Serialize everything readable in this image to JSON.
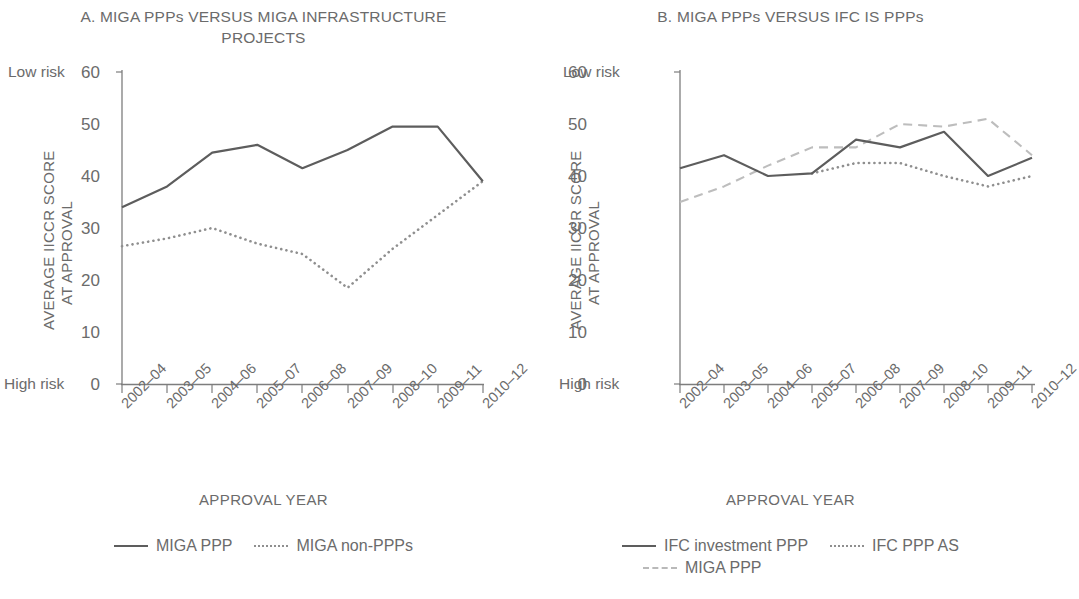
{
  "figure": {
    "axis": {
      "y_title": "AVERAGE IICCR SCORE",
      "y_title_line2": "AT APPROVAL",
      "x_title": "APPROVAL YEAR",
      "y_low_label": "Low risk",
      "y_high_label": "High risk",
      "y_ticks": [
        "60",
        "50",
        "40",
        "30",
        "20",
        "10",
        "0"
      ],
      "x_ticks": [
        "2002–04",
        "2003–05",
        "2004–06",
        "2005–07",
        "2006–08",
        "2007–09",
        "2008–10",
        "2009–11",
        "2010–12"
      ]
    },
    "colors": {
      "solid": "#5d5d5d",
      "dotted": "#8f8f8f",
      "dashed": "#bdbdbd",
      "axis": "#7d7d7d",
      "text": "#6b6b6b"
    }
  },
  "chart_data": [
    {
      "type": "line",
      "panel": "A",
      "title": "A. MIGA PPPs VERSUS MIGA INFRASTRUCTURE PROJECTS",
      "xlabel": "APPROVAL YEAR",
      "ylabel": "AVERAGE IICCR SCORE AT APPROVAL",
      "ylim": [
        0,
        60
      ],
      "yticks": [
        0,
        10,
        20,
        30,
        40,
        50,
        60
      ],
      "grid": false,
      "legend_position": "bottom",
      "categories": [
        "2002–04",
        "2003–05",
        "2004–06",
        "2005–07",
        "2006–08",
        "2007–09",
        "2008–10",
        "2009–11",
        "2010–12"
      ],
      "series": [
        {
          "name": "MIGA PPP",
          "style": "solid",
          "values": [
            34,
            38,
            44.5,
            46,
            41.5,
            45,
            49.5,
            49.5,
            39
          ]
        },
        {
          "name": "MIGA non-PPPs",
          "style": "dotted",
          "values": [
            26.5,
            28,
            30,
            27,
            25,
            18.5,
            26,
            32.5,
            39
          ]
        }
      ],
      "annotations": {
        "y_axis_top": "Low risk",
        "y_axis_bottom": "High risk"
      }
    },
    {
      "type": "line",
      "panel": "B",
      "title": "B. MIGA PPPs VERSUS IFC IS PPPs",
      "xlabel": "APPROVAL YEAR",
      "ylabel": "AVERAGE IICCR SCORE AT APPROVAL",
      "ylim": [
        0,
        60
      ],
      "yticks": [
        0,
        10,
        20,
        30,
        40,
        50,
        60
      ],
      "grid": false,
      "legend_position": "bottom",
      "categories": [
        "2002–04",
        "2003–05",
        "2004–06",
        "2005–07",
        "2006–08",
        "2007–09",
        "2008–10",
        "2009–11",
        "2010–12"
      ],
      "series": [
        {
          "name": "IFC investment PPP",
          "style": "solid",
          "values": [
            41.5,
            44,
            40,
            40.5,
            47,
            45.5,
            48.5,
            40,
            43.5
          ]
        },
        {
          "name": "IFC PPP AS",
          "style": "dotted",
          "values": [
            null,
            null,
            null,
            40.5,
            42.5,
            42.5,
            40,
            38,
            40
          ]
        },
        {
          "name": "MIGA PPP",
          "style": "dashed",
          "values": [
            35,
            38,
            42,
            45.5,
            45.5,
            50,
            49.5,
            51,
            44
          ]
        }
      ],
      "annotations": {
        "y_axis_top": "Low risk",
        "y_axis_bottom": "High risk"
      }
    }
  ],
  "panels": {
    "a": {
      "title": "A. MIGA PPPs VERSUS MIGA INFRASTRUCTURE PROJECTS",
      "legend": [
        {
          "label": "MIGA PPP",
          "style": "solid"
        },
        {
          "label": "MIGA non-PPPs",
          "style": "dotted"
        }
      ]
    },
    "b": {
      "title": "B. MIGA PPPs VERSUS IFC IS PPPs",
      "legend": [
        {
          "label": "IFC investment PPP",
          "style": "solid"
        },
        {
          "label": "IFC PPP AS",
          "style": "dotted"
        },
        {
          "label": "MIGA PPP",
          "style": "dashed"
        }
      ]
    }
  }
}
